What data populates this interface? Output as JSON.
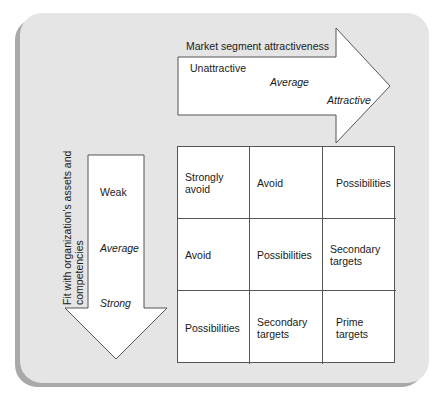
{
  "diagram": {
    "type": "market-segment-matrix",
    "colors": {
      "panel": "#e5e5e5",
      "panel_shadow": "#a9a9a9",
      "arrow_fill": "#ffffff",
      "stroke": "#555555"
    }
  },
  "horizontal_axis": {
    "title": "Market segment attractiveness",
    "levels": [
      "Unattractive",
      "Average",
      "Attractive"
    ]
  },
  "vertical_axis": {
    "title": "Fit with organization's assets and competencies",
    "levels": [
      "Weak",
      "Average",
      "Strong"
    ]
  },
  "matrix": {
    "rows": [
      [
        "Strongly avoid",
        "Avoid",
        "Possibilities"
      ],
      [
        "Avoid",
        "Possibilities",
        "Secondary targets"
      ],
      [
        "Possibilities",
        "Secondary targets",
        "Prime targets"
      ]
    ]
  }
}
